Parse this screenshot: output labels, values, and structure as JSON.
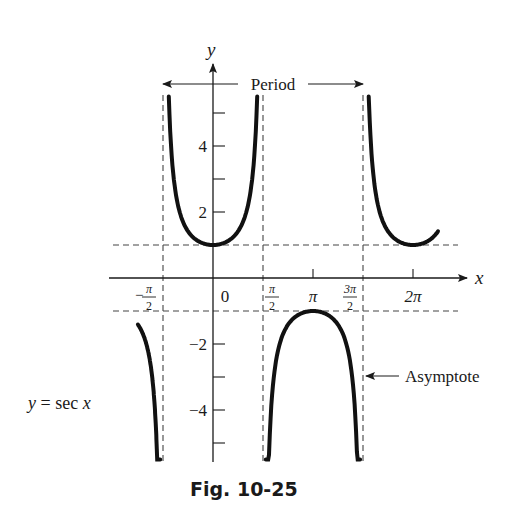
{
  "chart_data": {
    "type": "line",
    "title": "y = sec x",
    "function_label": "y = sec x",
    "caption": "Fig. 10-25",
    "xlabel": "x",
    "ylabel": "y",
    "x_ticks": [
      {
        "value": -1.5708,
        "label": "-π/2",
        "num": "π",
        "den": "2",
        "neg": true
      },
      {
        "value": 0,
        "label": "0"
      },
      {
        "value": 1.5708,
        "label": "π/2",
        "num": "π",
        "den": "2"
      },
      {
        "value": 3.1416,
        "label": "π"
      },
      {
        "value": 4.7124,
        "label": "3π/2",
        "num": "3π",
        "den": "2"
      },
      {
        "value": 6.2832,
        "label": "2π"
      }
    ],
    "y_ticks": [
      {
        "value": 5,
        "label": ""
      },
      {
        "value": 4,
        "label": "4"
      },
      {
        "value": 3,
        "label": ""
      },
      {
        "value": 2,
        "label": "2"
      },
      {
        "value": -2,
        "label": "-2"
      },
      {
        "value": -3,
        "label": ""
      },
      {
        "value": -4,
        "label": "-4"
      },
      {
        "value": -5,
        "label": ""
      }
    ],
    "asymptotes_x": [
      -1.5708,
      1.5708,
      4.7124
    ],
    "reference_lines_y": [
      1,
      -1
    ],
    "xlim": [
      -3.93,
      7.2
    ],
    "ylim": [
      -5.6,
      5.6
    ],
    "series": [
      {
        "name": "sec x branch (-3π/4 to -π/2)",
        "x_range": [
          -2.36,
          -1.66
        ],
        "shape": "downward, max -1 at x=-π"
      },
      {
        "name": "sec x branch (-π/2 to π/2)",
        "x_range": [
          -1.39,
          1.39
        ],
        "shape": "upward, min 1 at x=0"
      },
      {
        "name": "sec x branch (π/2 to 3π/2)",
        "x_range": [
          1.66,
          4.62
        ],
        "shape": "downward, max -1 at x=π"
      },
      {
        "name": "sec x branch (3π/2 to 9π/4)",
        "x_range": [
          4.89,
          7.07
        ],
        "shape": "upward, min 1 at x=2π"
      }
    ],
    "annotations": [
      {
        "text": "Period",
        "type": "double-arrow",
        "from_x": -1.5708,
        "to_x": 4.7124
      },
      {
        "text": "Asymptote",
        "type": "arrow",
        "points_to_x": 4.7124
      }
    ],
    "grid": false,
    "legend": "none"
  }
}
